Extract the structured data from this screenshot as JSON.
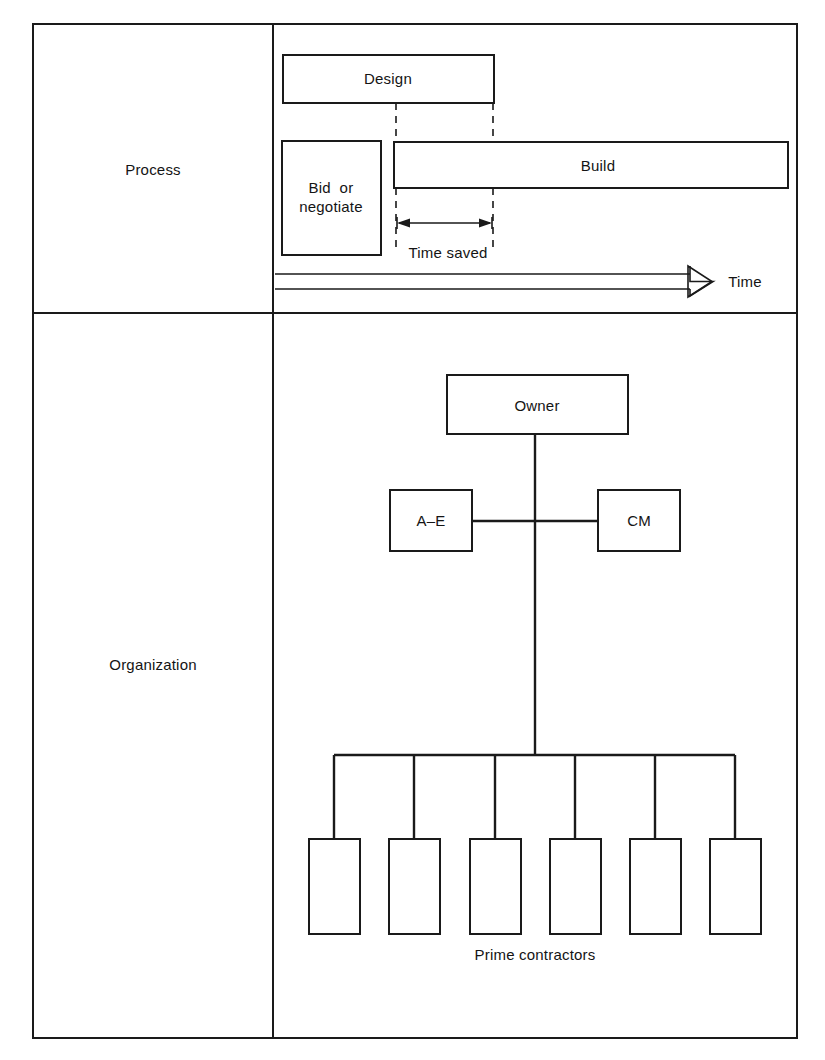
{
  "figure": {
    "type": "construction-management-diagram",
    "stroke_color": "#1a1a1a",
    "background_color": "#ffffff",
    "rows": [
      {
        "key": "process",
        "label": "Process"
      },
      {
        "key": "organization",
        "label": "Organization"
      }
    ]
  },
  "process": {
    "row_label": "Process",
    "bars": [
      {
        "name": "design-bar",
        "label": "Design"
      },
      {
        "name": "bid-bar",
        "label": "Bid  or\nnegotiate"
      },
      {
        "name": "build-bar",
        "label": "Build"
      }
    ],
    "design_label": "Design",
    "bid_label": "Bid  or\nnegotiate",
    "build_label": "Build",
    "time_saved_label": "Time saved",
    "time_axis_label": "Time"
  },
  "organization": {
    "row_label": "Organization",
    "nodes": [
      {
        "name": "owner-node",
        "label": "Owner"
      },
      {
        "name": "ae-node",
        "label": "A–E"
      },
      {
        "name": "cm-node",
        "label": "CM"
      }
    ],
    "owner_label": "Owner",
    "ae_label": "A–E",
    "cm_label": "CM",
    "prime_contractors_label": "Prime contractors",
    "prime_contractor_count": 6,
    "prime_contractors": [
      {
        "name": "prime-contractor-1",
        "label": ""
      },
      {
        "name": "prime-contractor-2",
        "label": ""
      },
      {
        "name": "prime-contractor-3",
        "label": ""
      },
      {
        "name": "prime-contractor-4",
        "label": ""
      },
      {
        "name": "prime-contractor-5",
        "label": ""
      },
      {
        "name": "prime-contractor-6",
        "label": ""
      }
    ]
  }
}
